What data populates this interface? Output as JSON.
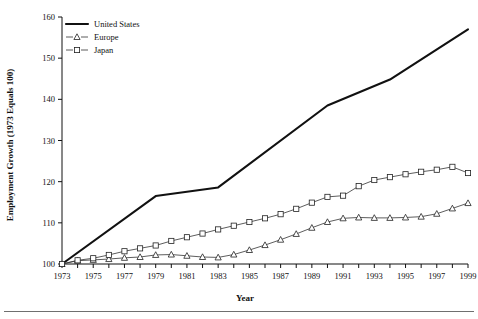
{
  "chart_data": {
    "type": "line",
    "title": "",
    "xlabel": "Year",
    "ylabel": "Employment Growth (1973 Equals 100)",
    "xlim": [
      1973,
      1999
    ],
    "ylim": [
      100,
      160
    ],
    "yticks": [
      100,
      110,
      120,
      130,
      140,
      150,
      160
    ],
    "xticks": [
      1973,
      1974,
      1975,
      1976,
      1977,
      1978,
      1979,
      1980,
      1981,
      1982,
      1983,
      1984,
      1985,
      1986,
      1987,
      1988,
      1989,
      1990,
      1991,
      1992,
      1993,
      1994,
      1995,
      1996,
      1997,
      1998,
      1999
    ],
    "xtick_labels": [
      "1973",
      "",
      "1975",
      "",
      "1977",
      "",
      "1979",
      "",
      "1981",
      "",
      "1983",
      "",
      "1985",
      "",
      "1987",
      "",
      "1989",
      "",
      "1991",
      "",
      "1993",
      "",
      "1995",
      "",
      "1997",
      "",
      "1999"
    ],
    "grid": false,
    "legend_position": "top-left",
    "x": [
      1973,
      1974,
      1975,
      1976,
      1977,
      1978,
      1979,
      1980,
      1981,
      1982,
      1983,
      1984,
      1985,
      1986,
      1987,
      1988,
      1989,
      1990,
      1991,
      1992,
      1993,
      1994,
      1995,
      1996,
      1997,
      1998,
      1999
    ],
    "series": [
      {
        "name": "United States",
        "marker": "none",
        "values": [
          100.0,
          102.1,
          104.2,
          106.3,
          108.4,
          110.5,
          112.6,
          113.8,
          115.0,
          115.9,
          116.8,
          118.5,
          120.5,
          122.6,
          124.8,
          127.0,
          129.2,
          131.4,
          133.6,
          135.8,
          138.0,
          139.6,
          141.2,
          142.8,
          144.4,
          146.0,
          147.6
        ]
      },
      {
        "name": "Europe",
        "marker": "triangle",
        "values": [
          100.0,
          100.8,
          101.0,
          101.2,
          101.5,
          101.7,
          102.2,
          102.3,
          102.0,
          101.7,
          101.6,
          102.3,
          103.4,
          104.6,
          105.9,
          107.3,
          108.8,
          110.2,
          111.1,
          111.3,
          111.2,
          111.2,
          111.3,
          111.5,
          112.2,
          113.5,
          114.8
        ]
      },
      {
        "name": "Japan",
        "marker": "square",
        "values": [
          100.0,
          100.9,
          101.4,
          102.2,
          103.1,
          103.8,
          104.5,
          105.6,
          106.5,
          107.4,
          108.4,
          109.3,
          110.2,
          111.1,
          112.1,
          113.4,
          114.9,
          116.3,
          116.6,
          118.9,
          120.4,
          121.1,
          121.8,
          122.4,
          122.9,
          123.6,
          122.1
        ]
      }
    ],
    "us_breakpoints": [
      {
        "year": 1973,
        "value": 100.0
      },
      {
        "year": 1979,
        "value": 116.5
      },
      {
        "year": 1983,
        "value": 118.6
      },
      {
        "year": 1990,
        "value": 138.5
      },
      {
        "year": 1994,
        "value": 144.8
      },
      {
        "year": 1999,
        "value": 157.0
      }
    ]
  },
  "legend": {
    "entries": [
      {
        "label": "United States",
        "marker": "line"
      },
      {
        "label": "Europe",
        "marker": "triangle"
      },
      {
        "label": "Japan",
        "marker": "square"
      }
    ]
  },
  "colors": {
    "us_line": "#111111",
    "europe_line": "#333333",
    "japan_line": "#333333",
    "axis": "#111111",
    "marker_fill": "#ffffff",
    "background": "#ffffff",
    "footer_rule": "#6f6f6f"
  }
}
